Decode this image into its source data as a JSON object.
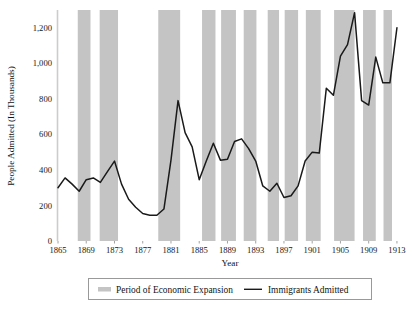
{
  "chart_data": {
    "type": "line",
    "title": "",
    "xlabel": "Year",
    "ylabel": "People Admitted (In Thousands)",
    "xlim": [
      1865,
      1914
    ],
    "ylim": [
      0,
      1300
    ],
    "grid": false,
    "legend_position": "bottom",
    "xticks": [
      "1865",
      "1869",
      "1873",
      "1877",
      "1881",
      "1885",
      "1889",
      "1893",
      "1897",
      "1901",
      "1905",
      "1909",
      "1913"
    ],
    "xtick_values": [
      1865,
      1869,
      1873,
      1877,
      1881,
      1885,
      1889,
      1893,
      1897,
      1901,
      1905,
      1909,
      1913
    ],
    "yticks": [
      "0",
      "200",
      "400",
      "600",
      "800",
      "1,000",
      "1,200"
    ],
    "ytick_values": [
      0,
      200,
      400,
      600,
      800,
      1000,
      1200
    ],
    "series": [
      {
        "name": "Immigrants Admitted",
        "color": "#1a1a1a",
        "x": [
          1865,
          1866,
          1867,
          1868,
          1869,
          1870,
          1871,
          1872,
          1873,
          1874,
          1875,
          1876,
          1877,
          1878,
          1879,
          1880,
          1881,
          1882,
          1883,
          1884,
          1885,
          1886,
          1887,
          1888,
          1889,
          1890,
          1891,
          1892,
          1893,
          1894,
          1895,
          1896,
          1897,
          1898,
          1899,
          1900,
          1901,
          1902,
          1903,
          1904,
          1905,
          1906,
          1907,
          1908,
          1909,
          1910,
          1911,
          1912,
          1913
        ],
        "values": [
          300,
          355,
          320,
          280,
          345,
          355,
          330,
          390,
          450,
          320,
          235,
          190,
          155,
          145,
          145,
          180,
          455,
          790,
          610,
          530,
          345,
          450,
          550,
          455,
          460,
          560,
          575,
          520,
          450,
          310,
          280,
          325,
          245,
          255,
          310,
          450,
          500,
          495,
          860,
          820,
          1040,
          1105,
          1285,
          790,
          765,
          1035,
          890,
          890,
          1200
        ],
        "unit": "thousands",
        "peak_year": 1907,
        "peak_value": 1285,
        "min_year": 1878,
        "min_value": 145
      }
    ],
    "shaded_regions": {
      "name": "Period of Economic Expansion",
      "color": "#c4c4c4",
      "spans": [
        [
          1867.8,
          1869.6
        ],
        [
          1870.9,
          1873.5
        ],
        [
          1879.2,
          1882.3
        ],
        [
          1885.4,
          1887.3
        ],
        [
          1888.1,
          1890.2
        ],
        [
          1891.3,
          1893.1
        ],
        [
          1894.7,
          1896.3
        ],
        [
          1897.1,
          1899.0
        ],
        [
          1900.1,
          1902.2
        ],
        [
          1904.1,
          1907.0
        ],
        [
          1908.2,
          1910.0
        ],
        [
          1911.1,
          1912.3
        ]
      ]
    }
  },
  "legend": {
    "items": [
      {
        "label": "Period of Economic Expansion",
        "marker": "swatch",
        "color": "#c4c4c4"
      },
      {
        "label": "Immigrants Admitted",
        "marker": "line",
        "color": "#1a1a1a"
      }
    ]
  },
  "caption": {
    "text": ""
  }
}
